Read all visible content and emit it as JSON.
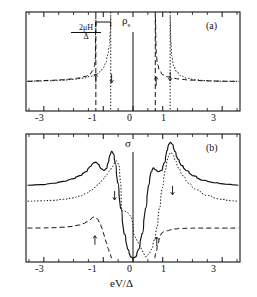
{
  "figure": {
    "panels": [
      {
        "id": "a",
        "label": "(a)",
        "ylabel": "ρ",
        "ylabel_sub": "s",
        "annotation_numerator": "2μH",
        "annotation_denominator": "Δ",
        "xticks": [
          "-3",
          "-1",
          "0",
          "1",
          "3"
        ],
        "arrow_down": "↓",
        "arrow_up": "↑"
      },
      {
        "id": "b",
        "label": "(b)",
        "ylabel": "σ",
        "xticks": [
          "-3",
          "-1",
          "0",
          "1",
          "3"
        ],
        "xlabel": "eV/Δ",
        "arrow_down": "↓",
        "arrow_up": "↑"
      }
    ]
  },
  "chart_data": [
    {
      "type": "line",
      "panel": "a",
      "title": "ρs",
      "xlabel": "",
      "ylabel": "ρs",
      "xlim": [
        -3.6,
        3.6
      ],
      "ylim": [
        0,
        1
      ],
      "xticks": [
        -3,
        -1,
        0,
        1,
        3
      ],
      "grid": false,
      "legend": "none",
      "annotations": [
        {
          "text": "2μH/Δ",
          "x": -1.0,
          "y": 0.86,
          "type": "bracket-span",
          "span": [
            -1.25,
            -0.75
          ]
        },
        {
          "text": "↓",
          "x": -1.25,
          "y": 0.33
        },
        {
          "text": "↑",
          "x": -0.72,
          "y": 0.33
        },
        {
          "text": "↓",
          "x": 0.78,
          "y": 0.3
        },
        {
          "text": "↑",
          "x": 1.25,
          "y": 0.35
        },
        {
          "text": "(a)",
          "x": 2.85,
          "y": 0.88
        }
      ],
      "series": [
        {
          "name": "spin-down",
          "style": "dashed",
          "divergences": [
            -1.25,
            0.75
          ],
          "x": [
            -3.55,
            -3.2,
            -2.8,
            -2.4,
            -2.0,
            -1.8,
            -1.6,
            -1.45,
            -1.35,
            -1.3,
            -1.27,
            -1.25,
            0.75,
            0.78,
            0.82,
            0.9,
            1.0,
            1.15,
            1.35,
            1.6,
            1.9,
            2.3,
            2.8,
            3.2,
            3.55
          ],
          "y": [
            0.3,
            0.305,
            0.31,
            0.315,
            0.325,
            0.335,
            0.35,
            0.375,
            0.41,
            0.45,
            0.52,
            0.95,
            0.95,
            0.58,
            0.47,
            0.4,
            0.365,
            0.345,
            0.33,
            0.32,
            0.312,
            0.306,
            0.302,
            0.3,
            0.3
          ]
        },
        {
          "name": "spin-up",
          "style": "dotted",
          "divergences": [
            -0.75,
            1.25
          ],
          "x": [
            -3.55,
            -3.2,
            -2.8,
            -2.4,
            -2.0,
            -1.7,
            -1.45,
            -1.25,
            -1.1,
            -1.0,
            -0.92,
            -0.85,
            -0.8,
            -0.76,
            -0.75,
            1.25,
            1.27,
            1.3,
            1.36,
            1.45,
            1.6,
            1.8,
            2.1,
            2.5,
            3.0,
            3.55
          ],
          "y": [
            0.3,
            0.302,
            0.306,
            0.312,
            0.32,
            0.332,
            0.35,
            0.37,
            0.4,
            0.44,
            0.49,
            0.57,
            0.66,
            0.82,
            0.95,
            0.95,
            0.7,
            0.56,
            0.46,
            0.4,
            0.355,
            0.33,
            0.315,
            0.305,
            0.3,
            0.3
          ]
        }
      ]
    },
    {
      "type": "line",
      "panel": "b",
      "title": "σ",
      "xlabel": "eV/Δ",
      "ylabel": "σ",
      "xlim": [
        -3.6,
        3.6
      ],
      "ylim": [
        0,
        1
      ],
      "xticks": [
        -3,
        -1,
        0,
        1,
        3
      ],
      "grid": false,
      "legend": "none",
      "annotations": [
        {
          "text": "↑",
          "x": -0.62,
          "y": 0.52
        },
        {
          "text": "↑",
          "x": 1.33,
          "y": 0.56
        },
        {
          "text": "↓",
          "x": -1.28,
          "y": 0.17
        },
        {
          "text": "↓",
          "x": 0.8,
          "y": 0.16
        },
        {
          "text": "(b)",
          "x": 2.85,
          "y": 0.88
        }
      ],
      "series": [
        {
          "name": "total",
          "style": "solid",
          "x": [
            -3.55,
            -3.1,
            -2.7,
            -2.35,
            -2.05,
            -1.8,
            -1.6,
            -1.45,
            -1.33,
            -1.25,
            -1.18,
            -1.08,
            -0.98,
            -0.9,
            -0.84,
            -0.78,
            -0.72,
            -0.66,
            -0.6,
            -0.52,
            -0.42,
            -0.3,
            -0.18,
            -0.08,
            0,
            0.08,
            0.18,
            0.3,
            0.42,
            0.52,
            0.6,
            0.68,
            0.76,
            0.84,
            0.95,
            1.05,
            1.14,
            1.2,
            1.26,
            1.32,
            1.4,
            1.5,
            1.62,
            1.78,
            2.0,
            2.3,
            2.7,
            3.1,
            3.55
          ],
          "y": [
            0.6,
            0.605,
            0.615,
            0.63,
            0.65,
            0.675,
            0.705,
            0.745,
            0.775,
            0.78,
            0.765,
            0.73,
            0.715,
            0.73,
            0.775,
            0.835,
            0.865,
            0.845,
            0.77,
            0.62,
            0.42,
            0.22,
            0.1,
            0.04,
            0.03,
            0.04,
            0.1,
            0.22,
            0.42,
            0.6,
            0.7,
            0.735,
            0.72,
            0.705,
            0.715,
            0.775,
            0.87,
            0.92,
            0.935,
            0.92,
            0.865,
            0.805,
            0.755,
            0.715,
            0.675,
            0.64,
            0.62,
            0.608,
            0.6
          ]
        },
        {
          "name": "spin-up",
          "style": "dotted",
          "x": [
            -3.55,
            -3.1,
            -2.7,
            -2.35,
            -2.05,
            -1.8,
            -1.6,
            -1.42,
            -1.28,
            -1.15,
            -1.0,
            -0.88,
            -0.78,
            -0.7,
            -0.62,
            -0.55,
            -0.48,
            -0.42,
            -0.38,
            0.42,
            0.52,
            0.62,
            0.72,
            0.8,
            0.88,
            0.98,
            1.08,
            1.16,
            1.22,
            1.28,
            1.34,
            1.42,
            1.52,
            1.66,
            1.85,
            2.1,
            2.45,
            2.9,
            3.3,
            3.55
          ],
          "y": [
            0.475,
            0.478,
            0.482,
            0.49,
            0.5,
            0.515,
            0.535,
            0.56,
            0.585,
            0.615,
            0.65,
            0.685,
            0.715,
            0.745,
            0.775,
            0.79,
            0.76,
            0.62,
            0.4,
            0.04,
            0.06,
            0.1,
            0.18,
            0.27,
            0.42,
            0.58,
            0.72,
            0.805,
            0.845,
            0.855,
            0.84,
            0.79,
            0.735,
            0.675,
            0.615,
            0.565,
            0.52,
            0.49,
            0.478,
            0.475
          ]
        },
        {
          "name": "spin-down",
          "style": "dashed",
          "x": [
            -3.55,
            -3.1,
            -2.7,
            -2.35,
            -2.05,
            -1.85,
            -1.68,
            -1.55,
            -1.45,
            -1.38,
            -1.32,
            -1.26,
            -1.2,
            -1.12,
            -1.04,
            -0.96,
            -0.9,
            -0.84,
            -0.78,
            -0.72,
            0.72,
            0.78,
            0.84,
            0.9,
            0.96,
            1.02,
            1.08,
            1.16,
            1.26,
            1.4,
            1.6,
            1.85,
            2.2,
            2.65,
            3.1,
            3.55
          ],
          "y": [
            0.265,
            0.266,
            0.268,
            0.272,
            0.278,
            0.288,
            0.3,
            0.315,
            0.33,
            0.345,
            0.352,
            0.35,
            0.335,
            0.305,
            0.26,
            0.2,
            0.15,
            0.105,
            0.065,
            0.03,
            0.03,
            0.085,
            0.145,
            0.195,
            0.225,
            0.235,
            0.238,
            0.245,
            0.252,
            0.258,
            0.262,
            0.264,
            0.265,
            0.265,
            0.265,
            0.265
          ]
        }
      ]
    }
  ]
}
